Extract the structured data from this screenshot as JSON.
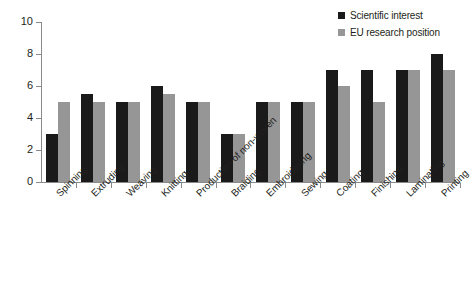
{
  "chart_data": {
    "type": "bar",
    "title": "",
    "subtitle": "",
    "xlabel": "",
    "ylabel": "",
    "ylim": [
      0,
      10
    ],
    "yticks": [
      0,
      2,
      4,
      6,
      8,
      10
    ],
    "grid": false,
    "legend_position": "top-right",
    "categories": [
      "Spinning",
      "Extruding",
      "Weaving",
      "Knitting",
      "Production of non-woven",
      "Braiding",
      "Embroidering",
      "Sewing",
      "Coating",
      "Finishing",
      "Laminating",
      "Printing"
    ],
    "series": [
      {
        "name": "Scientific interest",
        "color": "#1a1a1a",
        "values": [
          3,
          5.5,
          5,
          6,
          5,
          3,
          5,
          5,
          7,
          7,
          7,
          8
        ]
      },
      {
        "name": "EU research position",
        "color": "#969696",
        "values": [
          5,
          5,
          5,
          5.5,
          5,
          3,
          5,
          5,
          6,
          5,
          7,
          7
        ]
      }
    ]
  },
  "legend": {
    "entries": [
      {
        "label": "Scientific interest",
        "swatch": "legend-swatch-dark"
      },
      {
        "label": "EU research position",
        "swatch": "legend-swatch-gray"
      }
    ]
  },
  "axis": {
    "y_tick_labels": [
      "0",
      "2",
      "4",
      "6",
      "8",
      "10"
    ]
  }
}
